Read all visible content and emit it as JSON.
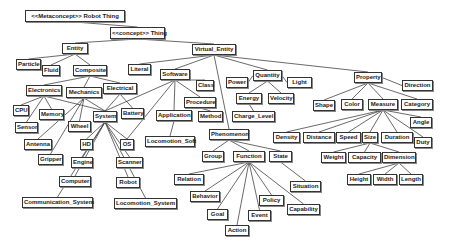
{
  "diagram": {
    "nodes": [
      {
        "id": "metaconcept",
        "label": "<<Metaconcept>> Robot Thing",
        "x": 25,
        "y": 10,
        "w": 100,
        "h": 12
      },
      {
        "id": "thing",
        "label": "<<concept>> Thing",
        "x": 110,
        "y": 27,
        "w": 55,
        "h": 12
      },
      {
        "id": "entity",
        "label": "Entity",
        "x": 62,
        "y": 43,
        "w": 26,
        "h": 11
      },
      {
        "id": "virtual_entity",
        "label": "Virtual_Entity",
        "x": 192,
        "y": 44,
        "w": 44,
        "h": 11
      },
      {
        "id": "particle",
        "label": "Particle",
        "x": 16,
        "y": 59,
        "w": 25,
        "h": 11
      },
      {
        "id": "fluid",
        "label": "Fluid",
        "x": 42,
        "y": 65,
        "w": 18,
        "h": 11
      },
      {
        "id": "composite",
        "label": "Composite",
        "x": 73,
        "y": 65,
        "w": 34,
        "h": 11
      },
      {
        "id": "literal",
        "label": "Literal",
        "x": 128,
        "y": 64,
        "w": 23,
        "h": 11
      },
      {
        "id": "software",
        "label": "Software",
        "x": 160,
        "y": 69,
        "w": 30,
        "h": 11
      },
      {
        "id": "class",
        "label": "Class",
        "x": 196,
        "y": 80,
        "w": 18,
        "h": 11
      },
      {
        "id": "power",
        "label": "Power",
        "x": 226,
        "y": 77,
        "w": 22,
        "h": 11
      },
      {
        "id": "quantity",
        "label": "Quantity",
        "x": 253,
        "y": 70,
        "w": 29,
        "h": 11
      },
      {
        "id": "light",
        "label": "Light",
        "x": 287,
        "y": 77,
        "w": 25,
        "h": 11
      },
      {
        "id": "property",
        "label": "Property",
        "x": 354,
        "y": 72,
        "w": 28,
        "h": 11
      },
      {
        "id": "direction",
        "label": "Direction",
        "x": 402,
        "y": 80,
        "w": 31,
        "h": 11
      },
      {
        "id": "electronics",
        "label": "Electronics",
        "x": 26,
        "y": 85,
        "w": 36,
        "h": 11
      },
      {
        "id": "mechanics",
        "label": "Mechanics",
        "x": 66,
        "y": 87,
        "w": 36,
        "h": 11
      },
      {
        "id": "electrical",
        "label": "Electrical",
        "x": 103,
        "y": 83,
        "w": 34,
        "h": 11
      },
      {
        "id": "procedure",
        "label": "Procedure",
        "x": 184,
        "y": 97,
        "w": 32,
        "h": 11
      },
      {
        "id": "energy",
        "label": "Energy",
        "x": 236,
        "y": 93,
        "w": 26,
        "h": 11
      },
      {
        "id": "velocity",
        "label": "Velocity",
        "x": 268,
        "y": 93,
        "w": 26,
        "h": 11
      },
      {
        "id": "shape",
        "label": "Shape",
        "x": 313,
        "y": 100,
        "w": 22,
        "h": 11
      },
      {
        "id": "color",
        "label": "Color",
        "x": 341,
        "y": 99,
        "w": 22,
        "h": 11
      },
      {
        "id": "measure",
        "label": "Measure",
        "x": 368,
        "y": 99,
        "w": 30,
        "h": 11
      },
      {
        "id": "category",
        "label": "Category",
        "x": 401,
        "y": 99,
        "w": 32,
        "h": 11
      },
      {
        "id": "cpu",
        "label": "CPU",
        "x": 13,
        "y": 105,
        "w": 16,
        "h": 11
      },
      {
        "id": "memory",
        "label": "Memory",
        "x": 39,
        "y": 109,
        "w": 25,
        "h": 11
      },
      {
        "id": "system",
        "label": "System",
        "x": 93,
        "y": 111,
        "w": 24,
        "h": 11
      },
      {
        "id": "battery",
        "label": "Battery",
        "x": 121,
        "y": 108,
        "w": 23,
        "h": 11
      },
      {
        "id": "application",
        "label": "Application",
        "x": 156,
        "y": 110,
        "w": 36,
        "h": 11
      },
      {
        "id": "method",
        "label": "Method",
        "x": 198,
        "y": 111,
        "w": 25,
        "h": 11
      },
      {
        "id": "charge_level",
        "label": "Charge_Level",
        "x": 232,
        "y": 111,
        "w": 43,
        "h": 11
      },
      {
        "id": "angle",
        "label": "Angle",
        "x": 410,
        "y": 117,
        "w": 22,
        "h": 11
      },
      {
        "id": "sensor",
        "label": "Sensor",
        "x": 15,
        "y": 122,
        "w": 23,
        "h": 11
      },
      {
        "id": "wheel",
        "label": "Wheel",
        "x": 68,
        "y": 121,
        "w": 23,
        "h": 11
      },
      {
        "id": "antenna",
        "label": "Antenna",
        "x": 24,
        "y": 139,
        "w": 28,
        "h": 11
      },
      {
        "id": "hd",
        "label": "HD",
        "x": 80,
        "y": 139,
        "w": 13,
        "h": 11
      },
      {
        "id": "os",
        "label": "OS",
        "x": 120,
        "y": 139,
        "w": 14,
        "h": 11
      },
      {
        "id": "phenomenon",
        "label": "Phenomenon",
        "x": 209,
        "y": 129,
        "w": 40,
        "h": 11
      },
      {
        "id": "density",
        "label": "Density",
        "x": 273,
        "y": 132,
        "w": 27,
        "h": 11
      },
      {
        "id": "distance",
        "label": "Distance",
        "x": 303,
        "y": 132,
        "w": 32,
        "h": 11
      },
      {
        "id": "speed",
        "label": "Speed",
        "x": 336,
        "y": 132,
        "w": 25,
        "h": 11
      },
      {
        "id": "size",
        "label": "Size",
        "x": 362,
        "y": 132,
        "w": 16,
        "h": 11
      },
      {
        "id": "duration",
        "label": "Duration",
        "x": 381,
        "y": 132,
        "w": 32,
        "h": 11
      },
      {
        "id": "duty",
        "label": "Duty",
        "x": 414,
        "y": 137,
        "w": 18,
        "h": 11
      },
      {
        "id": "locomotion_soft",
        "label": "Locomotion_Soft",
        "x": 145,
        "y": 136,
        "w": 50,
        "h": 11
      },
      {
        "id": "gripper",
        "label": "Gripper",
        "x": 38,
        "y": 154,
        "w": 25,
        "h": 11
      },
      {
        "id": "engine",
        "label": "Engine",
        "x": 71,
        "y": 157,
        "w": 22,
        "h": 11
      },
      {
        "id": "scanner",
        "label": "Scanner",
        "x": 116,
        "y": 157,
        "w": 27,
        "h": 11
      },
      {
        "id": "group",
        "label": "Group",
        "x": 202,
        "y": 151,
        "w": 22,
        "h": 11
      },
      {
        "id": "function",
        "label": "Function",
        "x": 233,
        "y": 151,
        "w": 32,
        "h": 11
      },
      {
        "id": "state",
        "label": "State",
        "x": 269,
        "y": 151,
        "w": 23,
        "h": 11
      },
      {
        "id": "weight",
        "label": "Weight",
        "x": 321,
        "y": 152,
        "w": 25,
        "h": 11
      },
      {
        "id": "capacity",
        "label": "Capacity",
        "x": 348,
        "y": 152,
        "w": 33,
        "h": 11
      },
      {
        "id": "dimension",
        "label": "Dimension",
        "x": 382,
        "y": 152,
        "w": 34,
        "h": 11
      },
      {
        "id": "relation",
        "label": "Relation",
        "x": 174,
        "y": 174,
        "w": 30,
        "h": 11
      },
      {
        "id": "height",
        "label": "Height",
        "x": 347,
        "y": 174,
        "w": 24,
        "h": 11
      },
      {
        "id": "width",
        "label": "Width",
        "x": 373,
        "y": 174,
        "w": 24,
        "h": 11
      },
      {
        "id": "length",
        "label": "Length",
        "x": 399,
        "y": 174,
        "w": 24,
        "h": 11
      },
      {
        "id": "computer",
        "label": "Computer",
        "x": 59,
        "y": 176,
        "w": 32,
        "h": 11
      },
      {
        "id": "robot",
        "label": "Robot",
        "x": 116,
        "y": 177,
        "w": 24,
        "h": 11
      },
      {
        "id": "situation",
        "label": "Situation",
        "x": 290,
        "y": 181,
        "w": 31,
        "h": 11
      },
      {
        "id": "behavior",
        "label": "Behavior",
        "x": 190,
        "y": 191,
        "w": 30,
        "h": 11
      },
      {
        "id": "policy",
        "label": "Policy",
        "x": 259,
        "y": 195,
        "w": 25,
        "h": 11
      },
      {
        "id": "communication_system",
        "label": "Communication_System",
        "x": 22,
        "y": 197,
        "w": 71,
        "h": 11
      },
      {
        "id": "locomotion_system",
        "label": "Locomotion_System",
        "x": 114,
        "y": 198,
        "w": 63,
        "h": 11
      },
      {
        "id": "capability",
        "label": "Capability",
        "x": 287,
        "y": 204,
        "w": 33,
        "h": 11
      },
      {
        "id": "goal",
        "label": "Goal",
        "x": 207,
        "y": 209,
        "w": 21,
        "h": 11
      },
      {
        "id": "event",
        "label": "Event",
        "x": 248,
        "y": 210,
        "w": 23,
        "h": 11
      },
      {
        "id": "action",
        "label": "Action",
        "x": 225,
        "y": 225,
        "w": 24,
        "h": 11
      }
    ],
    "edges": [
      [
        "metaconcept",
        "thing"
      ],
      [
        "thing",
        "entity"
      ],
      [
        "thing",
        "virtual_entity"
      ],
      [
        "entity",
        "particle"
      ],
      [
        "entity",
        "fluid"
      ],
      [
        "entity",
        "composite"
      ],
      [
        "composite",
        "electronics"
      ],
      [
        "composite",
        "mechanics"
      ],
      [
        "composite",
        "electrical"
      ],
      [
        "electronics",
        "cpu"
      ],
      [
        "electronics",
        "memory"
      ],
      [
        "electronics",
        "sensor"
      ],
      [
        "electronics",
        "system"
      ],
      [
        "mechanics",
        "wheel"
      ],
      [
        "mechanics",
        "antenna"
      ],
      [
        "mechanics",
        "gripper"
      ],
      [
        "mechanics",
        "system"
      ],
      [
        "electrical",
        "system"
      ],
      [
        "electrical",
        "battery"
      ],
      [
        "system",
        "hd"
      ],
      [
        "system",
        "engine"
      ],
      [
        "system",
        "computer"
      ],
      [
        "system",
        "communication_system"
      ],
      [
        "system",
        "locomotion_system"
      ],
      [
        "system",
        "robot"
      ],
      [
        "system",
        "scanner"
      ],
      [
        "system",
        "os"
      ],
      [
        "virtual_entity",
        "literal"
      ],
      [
        "virtual_entity",
        "software"
      ],
      [
        "virtual_entity",
        "phenomenon"
      ],
      [
        "virtual_entity",
        "quantity"
      ],
      [
        "virtual_entity",
        "property"
      ],
      [
        "software",
        "class"
      ],
      [
        "software",
        "procedure"
      ],
      [
        "software",
        "application"
      ],
      [
        "software",
        "system"
      ],
      [
        "software",
        "os"
      ],
      [
        "procedure",
        "method"
      ],
      [
        "application",
        "locomotion_soft"
      ],
      [
        "quantity",
        "power"
      ],
      [
        "quantity",
        "light"
      ],
      [
        "quantity",
        "energy"
      ],
      [
        "quantity",
        "velocity"
      ],
      [
        "energy",
        "charge_level"
      ],
      [
        "property",
        "shape"
      ],
      [
        "property",
        "color"
      ],
      [
        "property",
        "measure"
      ],
      [
        "property",
        "category"
      ],
      [
        "property",
        "direction"
      ],
      [
        "measure",
        "density"
      ],
      [
        "measure",
        "distance"
      ],
      [
        "measure",
        "speed"
      ],
      [
        "measure",
        "size"
      ],
      [
        "measure",
        "duration"
      ],
      [
        "measure",
        "duty"
      ],
      [
        "measure",
        "angle"
      ],
      [
        "size",
        "weight"
      ],
      [
        "size",
        "capacity"
      ],
      [
        "size",
        "dimension"
      ],
      [
        "dimension",
        "height"
      ],
      [
        "dimension",
        "width"
      ],
      [
        "dimension",
        "length"
      ],
      [
        "phenomenon",
        "group"
      ],
      [
        "phenomenon",
        "function"
      ],
      [
        "phenomenon",
        "state"
      ],
      [
        "state",
        "situation"
      ],
      [
        "function",
        "relation"
      ],
      [
        "function",
        "behavior"
      ],
      [
        "function",
        "goal"
      ],
      [
        "function",
        "action"
      ],
      [
        "function",
        "event"
      ],
      [
        "function",
        "policy"
      ],
      [
        "function",
        "capability"
      ]
    ],
    "colors": {
      "line": "#444444",
      "border": "#333333",
      "background": "#ffffff",
      "text": "#1a1a1a"
    }
  }
}
